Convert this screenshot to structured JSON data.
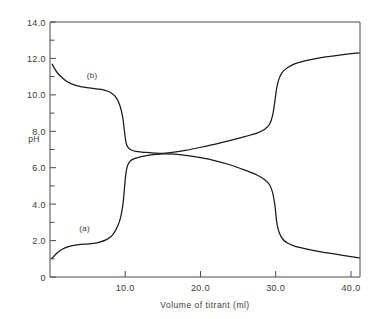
{
  "chart_data": {
    "type": "line",
    "title": "",
    "xlabel": "Volume of titrant (ml)",
    "ylabel": "pH",
    "xlim": [
      0,
      41.2
    ],
    "ylim": [
      0,
      14.0
    ],
    "grid": false,
    "legend": "inline-annotations",
    "xticks": [
      10.0,
      20.0,
      30.0,
      40.0
    ],
    "xticklabels": [
      "10.0",
      "20.0",
      "30.0",
      "40.0"
    ],
    "yticks": [
      0,
      2.0,
      4.0,
      6.0,
      8.0,
      10.0,
      12.0,
      14.0
    ],
    "yticklabels": [
      "0",
      "2.0",
      "4.0",
      "6.0",
      "8.0",
      "10.0",
      "12.0",
      "14.0"
    ],
    "yminorticks": [
      1,
      3,
      5,
      7,
      9,
      11,
      13
    ],
    "annotations": [
      {
        "text": "(a)",
        "x": 4.6,
        "y": 2.52
      },
      {
        "text": "(b)",
        "x": 5.6,
        "y": 10.95
      }
    ],
    "series": [
      {
        "name": "(a)",
        "label": "(a)",
        "color": "#1a1a1a",
        "x": [
          0.25,
          0.7,
          1.3,
          2.0,
          2.8,
          3.6,
          4.5,
          5.5,
          6.5,
          7.5,
          8.3,
          9.0,
          9.4,
          9.7,
          9.9,
          10.05,
          10.2,
          10.4,
          10.7,
          11.2,
          12.0,
          13.0,
          14.0,
          15.0,
          16.5,
          18.0,
          20.0,
          22.0,
          24.0,
          26.0,
          27.5,
          28.5,
          29.2,
          29.6,
          29.9,
          30.05,
          30.2,
          30.5,
          30.9,
          31.5,
          32.5,
          34.0,
          36.0,
          38.0,
          40.0,
          41.1
        ],
        "y": [
          1.02,
          1.22,
          1.44,
          1.6,
          1.71,
          1.77,
          1.8,
          1.83,
          1.9,
          2.05,
          2.3,
          2.8,
          3.3,
          4.0,
          4.9,
          5.55,
          5.95,
          6.2,
          6.38,
          6.5,
          6.6,
          6.68,
          6.73,
          6.76,
          6.74,
          6.68,
          6.55,
          6.38,
          6.15,
          5.85,
          5.6,
          5.35,
          5.05,
          4.6,
          3.9,
          3.3,
          2.85,
          2.4,
          2.1,
          1.88,
          1.7,
          1.55,
          1.38,
          1.25,
          1.12,
          1.05
        ],
        "notes": "Titration of base with acid: starts pH ~1.0 rising, buffer plateau ~1.8, steep inflection at 10 ml, mid-plateau ~6.7, steep drop at 30 ml, tail to ~1.05"
      },
      {
        "name": "(b)",
        "label": "(b)",
        "color": "#1a1a1a",
        "x": [
          0.3,
          0.6,
          1.0,
          1.6,
          2.3,
          3.2,
          4.2,
          5.3,
          6.4,
          7.3,
          8.1,
          8.8,
          9.3,
          9.65,
          9.9,
          10.05,
          10.2,
          10.45,
          10.8,
          11.4,
          12.2,
          13.2,
          14.2,
          15.0,
          16.5,
          18.0,
          20.0,
          22.0,
          24.0,
          26.0,
          27.5,
          28.5,
          29.2,
          29.6,
          29.9,
          30.1,
          30.3,
          30.6,
          31.0,
          31.6,
          32.5,
          34.0,
          36.0,
          38.0,
          40.0,
          41.1
        ],
        "y": [
          11.68,
          11.45,
          11.2,
          10.95,
          10.72,
          10.55,
          10.44,
          10.38,
          10.32,
          10.25,
          10.12,
          9.85,
          9.4,
          8.8,
          8.0,
          7.5,
          7.25,
          7.08,
          6.97,
          6.9,
          6.86,
          6.83,
          6.8,
          6.79,
          6.85,
          6.95,
          7.12,
          7.3,
          7.5,
          7.72,
          7.9,
          8.1,
          8.4,
          8.9,
          9.7,
          10.3,
          10.7,
          11.05,
          11.3,
          11.5,
          11.7,
          11.88,
          12.05,
          12.16,
          12.26,
          12.3
        ],
        "notes": "Titration of acid with base: starts pH ~11.7 falling, buffer plateau ~10.3, steep inflection at 10 ml, mid-plateau ~6.8 rising, steep rise at 30 ml, to ~12.3"
      }
    ],
    "crossing_point": {
      "x": 15.0,
      "y": 6.78
    }
  },
  "axes": {
    "x_title": "Volume of titrant (ml)",
    "y_title": "pH"
  }
}
